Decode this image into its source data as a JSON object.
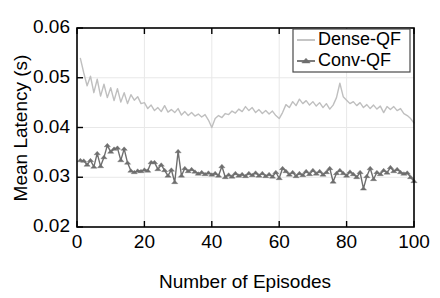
{
  "figure": {
    "partial_cropped_header": "",
    "background_color": "#ffffff",
    "plot_area": {
      "x": 77,
      "y": 28,
      "width": 337,
      "height": 199
    }
  },
  "chart_data": {
    "type": "line",
    "title": "",
    "xlabel": "Number of Episodes",
    "ylabel": "Mean Latency (s)",
    "xlim": [
      0,
      100
    ],
    "ylim": [
      0.02,
      0.06
    ],
    "xticks": [
      0,
      20,
      40,
      60,
      80,
      100
    ],
    "yticks": [
      0.02,
      0.03,
      0.04,
      0.05,
      0.06
    ],
    "xtick_labels": [
      "0",
      "20",
      "40",
      "60",
      "80",
      "100"
    ],
    "ytick_labels": [
      "0.02",
      "0.03",
      "0.04",
      "0.05",
      "0.06"
    ],
    "grid": true,
    "legend_position": "top-right",
    "x": [
      1,
      2,
      3,
      4,
      5,
      6,
      7,
      8,
      9,
      10,
      11,
      12,
      13,
      14,
      15,
      16,
      17,
      18,
      19,
      20,
      21,
      22,
      23,
      24,
      25,
      26,
      27,
      28,
      29,
      30,
      31,
      32,
      33,
      34,
      35,
      36,
      37,
      38,
      39,
      40,
      41,
      42,
      43,
      44,
      45,
      46,
      47,
      48,
      49,
      50,
      51,
      52,
      53,
      54,
      55,
      56,
      57,
      58,
      59,
      60,
      61,
      62,
      63,
      64,
      65,
      66,
      67,
      68,
      69,
      70,
      71,
      72,
      73,
      74,
      75,
      76,
      77,
      78,
      79,
      80,
      81,
      82,
      83,
      84,
      85,
      86,
      87,
      88,
      89,
      90,
      91,
      92,
      93,
      94,
      95,
      96,
      97,
      98,
      99,
      100
    ],
    "series": [
      {
        "name": "Dense-QF",
        "color": "#bfbfbf",
        "marker": "none",
        "linewidth": 1.4,
        "values": [
          0.0539,
          0.051,
          0.0484,
          0.0503,
          0.047,
          0.0497,
          0.0463,
          0.0487,
          0.046,
          0.048,
          0.0454,
          0.0478,
          0.0451,
          0.047,
          0.0448,
          0.0466,
          0.0455,
          0.0462,
          0.0448,
          0.045,
          0.0438,
          0.0445,
          0.0434,
          0.044,
          0.0432,
          0.0444,
          0.0431,
          0.0436,
          0.043,
          0.0438,
          0.0425,
          0.0432,
          0.0424,
          0.043,
          0.0423,
          0.0427,
          0.0421,
          0.0426,
          0.0415,
          0.04,
          0.0418,
          0.0424,
          0.042,
          0.0428,
          0.0426,
          0.0433,
          0.0429,
          0.0437,
          0.0432,
          0.0442,
          0.0434,
          0.044,
          0.043,
          0.0436,
          0.0428,
          0.0434,
          0.0427,
          0.0433,
          0.0424,
          0.0418,
          0.043,
          0.0446,
          0.044,
          0.0452,
          0.0444,
          0.0457,
          0.0448,
          0.0454,
          0.0445,
          0.0452,
          0.0443,
          0.045,
          0.044,
          0.0448,
          0.0437,
          0.0445,
          0.046,
          0.0489,
          0.0462,
          0.0455,
          0.0448,
          0.0452,
          0.0444,
          0.045,
          0.044,
          0.0446,
          0.0438,
          0.0445,
          0.0437,
          0.0443,
          0.043,
          0.0442,
          0.0436,
          0.0442,
          0.0434,
          0.0438,
          0.0428,
          0.0424,
          0.0418,
          0.0409
        ]
      },
      {
        "name": "Conv-QF",
        "color": "#6e6e6e",
        "marker": "triangle",
        "linewidth": 1.4,
        "values": [
          0.0334,
          0.0333,
          0.0325,
          0.0334,
          0.0321,
          0.0348,
          0.0322,
          0.034,
          0.0364,
          0.0351,
          0.0357,
          0.0359,
          0.0334,
          0.0357,
          0.0329,
          0.0313,
          0.031,
          0.0313,
          0.0312,
          0.0315,
          0.0313,
          0.033,
          0.033,
          0.0316,
          0.0325,
          0.0314,
          0.0303,
          0.0315,
          0.029,
          0.0352,
          0.0303,
          0.0318,
          0.0312,
          0.0316,
          0.0311,
          0.0307,
          0.031,
          0.0306,
          0.0309,
          0.0305,
          0.0308,
          0.0303,
          0.0322,
          0.03,
          0.0305,
          0.0301,
          0.0308,
          0.0303,
          0.0306,
          0.0302,
          0.0308,
          0.0304,
          0.0309,
          0.0303,
          0.0308,
          0.0302,
          0.0306,
          0.0301,
          0.031,
          0.0298,
          0.0318,
          0.0312,
          0.0305,
          0.031,
          0.0302,
          0.0308,
          0.0304,
          0.0312,
          0.0306,
          0.0314,
          0.0307,
          0.0312,
          0.0305,
          0.031,
          0.0318,
          0.0291,
          0.0308,
          0.0314,
          0.0308,
          0.0303,
          0.0311,
          0.0306,
          0.03,
          0.031,
          0.0277,
          0.0302,
          0.0318,
          0.0296,
          0.031,
          0.0306,
          0.0314,
          0.0309,
          0.032,
          0.0312,
          0.0316,
          0.031,
          0.0307,
          0.0309,
          0.03,
          0.0292
        ]
      }
    ]
  },
  "legend": {
    "items": [
      {
        "label": "Dense-QF",
        "color": "#bfbfbf",
        "marker": "none"
      },
      {
        "label": "Conv-QF",
        "color": "#6e6e6e",
        "marker": "triangle"
      }
    ]
  }
}
